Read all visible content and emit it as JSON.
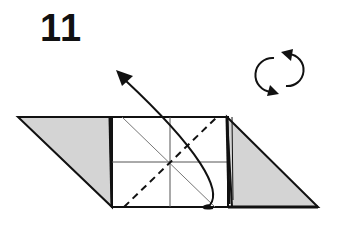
{
  "step": {
    "number": "11"
  },
  "symbols": {
    "rotate": {
      "icon": "rotate-model-icon",
      "meaning": "turn model over"
    },
    "fold_arrow": {
      "icon": "valley-fold-arrow-icon"
    }
  },
  "colors": {
    "line": "#111111",
    "fill_shaded": "#d4d4d4",
    "fill_paper": "#ffffff",
    "thin_line": "#555555"
  },
  "lines": {
    "valley_fold": "dashed",
    "creases": "thin"
  }
}
